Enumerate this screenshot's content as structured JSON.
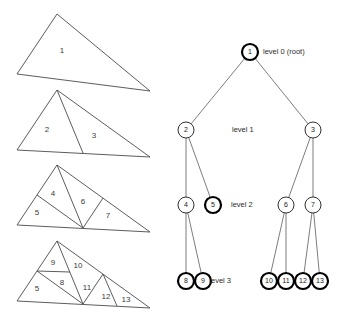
{
  "figure": {
    "canvas": {
      "width": 339,
      "height": 325
    }
  },
  "triangles": {
    "stage1": {
      "apex": [
        57,
        14
      ],
      "left": [
        17,
        74
      ],
      "right": [
        150,
        91
      ],
      "labels": [
        {
          "id": "1",
          "text": "1",
          "x": 62,
          "y": 51
        }
      ],
      "cuts": []
    },
    "stage2": {
      "apex": [
        57,
        90
      ],
      "left": [
        17,
        150
      ],
      "right": [
        150,
        157
      ],
      "labels": [
        {
          "id": "2",
          "text": "2",
          "x": 47,
          "y": 130
        },
        {
          "id": "3",
          "text": "3",
          "x": 94,
          "y": 136
        }
      ],
      "cuts": [
        {
          "id": "cut-apex-to-base-mid",
          "from": [
            57,
            90
          ],
          "to": [
            83,
            153
          ]
        }
      ]
    },
    "stage3": {
      "apex": [
        57,
        165
      ],
      "left": [
        17,
        225
      ],
      "right": [
        150,
        232
      ],
      "labels": [
        {
          "id": "4",
          "text": "4",
          "x": 53,
          "y": 194
        },
        {
          "id": "5",
          "text": "5",
          "x": 37,
          "y": 213
        },
        {
          "id": "6",
          "text": "6",
          "x": 83,
          "y": 202
        },
        {
          "id": "7",
          "text": "7",
          "x": 108,
          "y": 216
        }
      ],
      "cuts": [
        {
          "id": "cut-apex-to-base-mid",
          "from": [
            57,
            165
          ],
          "to": [
            83,
            228
          ]
        },
        {
          "id": "cut-left-median",
          "from": [
            83,
            228
          ],
          "to": [
            37,
            195
          ]
        },
        {
          "id": "cut-right-median",
          "from": [
            83,
            228
          ],
          "to": [
            103,
            198
          ]
        }
      ]
    },
    "stage4": {
      "apex": [
        57,
        241
      ],
      "left": [
        17,
        301
      ],
      "right": [
        150,
        308
      ],
      "labels": [
        {
          "id": "9",
          "text": "9",
          "x": 53,
          "y": 263
        },
        {
          "id": "10",
          "text": "10",
          "x": 78,
          "y": 266
        },
        {
          "id": "8",
          "text": "8",
          "x": 62,
          "y": 283
        },
        {
          "id": "11",
          "text": "11",
          "x": 87,
          "y": 288
        },
        {
          "id": "5",
          "text": "5",
          "x": 37,
          "y": 289
        },
        {
          "id": "12",
          "text": "12",
          "x": 106,
          "y": 297
        },
        {
          "id": "13",
          "text": "13",
          "x": 126,
          "y": 300
        }
      ],
      "cuts": [
        {
          "id": "cut-apex-to-base-mid",
          "from": [
            57,
            241
          ],
          "to": [
            83,
            304
          ]
        },
        {
          "id": "cut-left-median",
          "from": [
            83,
            304
          ],
          "to": [
            37,
            271
          ]
        },
        {
          "id": "cut-right-median",
          "from": [
            83,
            304
          ],
          "to": [
            103,
            274
          ]
        },
        {
          "id": "cut-sub-9-8",
          "from": [
            37,
            271
          ],
          "to": [
            70,
            272
          ]
        },
        {
          "id": "cut-sub-12-13",
          "from": [
            103,
            274
          ],
          "to": [
            117,
            306
          ]
        }
      ]
    }
  },
  "tree": {
    "nodes": [
      {
        "id": "1",
        "label": "1",
        "x": 250,
        "y": 52,
        "r": 8,
        "bold": true,
        "level": 0
      },
      {
        "id": "2",
        "label": "2",
        "x": 186,
        "y": 130,
        "r": 8,
        "bold": false,
        "level": 1
      },
      {
        "id": "3",
        "label": "3",
        "x": 313,
        "y": 130,
        "r": 8,
        "bold": false,
        "level": 1
      },
      {
        "id": "4",
        "label": "4",
        "x": 186,
        "y": 205,
        "r": 8,
        "bold": false,
        "level": 2
      },
      {
        "id": "5",
        "label": "5",
        "x": 213,
        "y": 205,
        "r": 8,
        "bold": true,
        "level": 2
      },
      {
        "id": "6",
        "label": "6",
        "x": 286,
        "y": 205,
        "r": 8,
        "bold": false,
        "level": 2
      },
      {
        "id": "7",
        "label": "7",
        "x": 313,
        "y": 205,
        "r": 8,
        "bold": false,
        "level": 2
      },
      {
        "id": "8",
        "label": "8",
        "x": 186,
        "y": 281,
        "r": 8,
        "bold": true,
        "level": 3
      },
      {
        "id": "9",
        "label": "9",
        "x": 203,
        "y": 281,
        "r": 8,
        "bold": true,
        "level": 3
      },
      {
        "id": "10",
        "label": "10",
        "x": 269,
        "y": 281,
        "r": 8,
        "bold": true,
        "level": 3
      },
      {
        "id": "11",
        "label": "11",
        "x": 286,
        "y": 281,
        "r": 8,
        "bold": true,
        "level": 3
      },
      {
        "id": "12",
        "label": "12",
        "x": 303,
        "y": 281,
        "r": 8,
        "bold": true,
        "level": 3
      },
      {
        "id": "13",
        "label": "13",
        "x": 320,
        "y": 281,
        "r": 8,
        "bold": true,
        "level": 3
      }
    ],
    "edges": [
      {
        "id": "e-1-2",
        "from": "1",
        "to": "2"
      },
      {
        "id": "e-1-3",
        "from": "1",
        "to": "3"
      },
      {
        "id": "e-2-4",
        "from": "2",
        "to": "4"
      },
      {
        "id": "e-2-5",
        "from": "2",
        "to": "5"
      },
      {
        "id": "e-3-6",
        "from": "3",
        "to": "6"
      },
      {
        "id": "e-3-7",
        "from": "3",
        "to": "7"
      },
      {
        "id": "e-4-8",
        "from": "4",
        "to": "8"
      },
      {
        "id": "e-4-9",
        "from": "4",
        "to": "9"
      },
      {
        "id": "e-6-10",
        "from": "6",
        "to": "10"
      },
      {
        "id": "e-6-11",
        "from": "6",
        "to": "11"
      },
      {
        "id": "e-7-12",
        "from": "7",
        "to": "12"
      },
      {
        "id": "e-7-13",
        "from": "7",
        "to": "13"
      }
    ],
    "level_labels": [
      {
        "id": "level-0",
        "text": "level 0 (root)",
        "x": 263,
        "y": 52,
        "anchor": "start"
      },
      {
        "id": "level-1",
        "text": "level 1",
        "x": 232,
        "y": 130,
        "anchor": "start"
      },
      {
        "id": "level-2",
        "text": "level 2",
        "x": 231,
        "y": 205,
        "anchor": "start"
      },
      {
        "id": "level-3",
        "text": "level 3",
        "x": 231,
        "y": 281,
        "anchor": "end"
      }
    ]
  },
  "colors": {
    "background": "#ffffff",
    "triangle_stroke": "#4a4a4a",
    "edge_stroke": "#6e6e6e",
    "node_stroke": "#1a1a1a",
    "text": "#1a1a1a"
  }
}
